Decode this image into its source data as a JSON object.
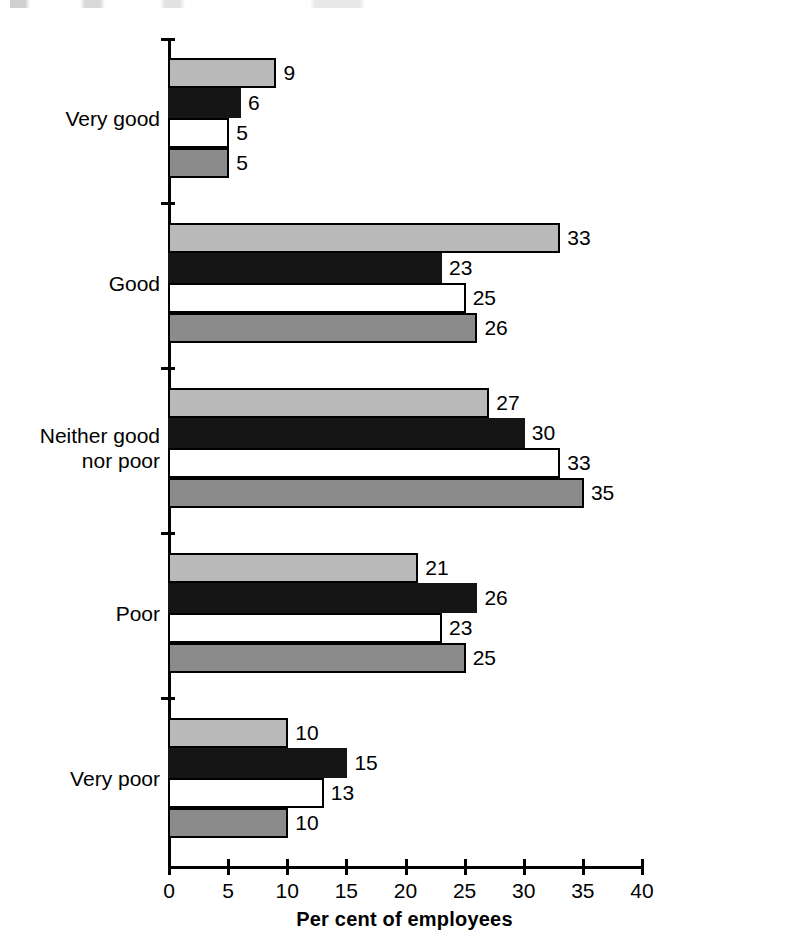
{
  "chart_data": {
    "type": "bar",
    "orientation": "horizontal",
    "title": "",
    "xlabel": "Per cent of employees",
    "ylabel": "",
    "xlim": [
      0,
      40
    ],
    "xticks": [
      0,
      5,
      10,
      15,
      20,
      25,
      30,
      35,
      40
    ],
    "grid": false,
    "legend": "none",
    "categories": [
      "Very good",
      "Good",
      "Neither good\nnor poor",
      "Poor",
      "Very poor"
    ],
    "category_lines": [
      [
        "Very good"
      ],
      [
        "Good"
      ],
      [
        "Neither good",
        "nor poor"
      ],
      [
        "Poor"
      ],
      [
        "Very poor"
      ]
    ],
    "series": [
      {
        "name": "series-1",
        "color": "#b9b9b9",
        "style": "light-grey",
        "values": [
          9,
          33,
          27,
          21,
          10
        ]
      },
      {
        "name": "series-2",
        "color": "#151515",
        "style": "black",
        "values": [
          6,
          23,
          30,
          26,
          15
        ]
      },
      {
        "name": "series-3",
        "color": "#ffffff",
        "style": "white",
        "values": [
          5,
          25,
          33,
          23,
          13
        ]
      },
      {
        "name": "series-4",
        "color": "#8b8b8b",
        "style": "mid-grey",
        "values": [
          5,
          26,
          35,
          25,
          10
        ]
      }
    ],
    "value_labels": {
      "Very good": [
        9,
        6,
        5,
        5
      ],
      "Good": [
        33,
        23,
        25,
        26
      ],
      "Neither good nor poor": [
        27,
        30,
        33,
        35
      ],
      "Poor": [
        21,
        26,
        23,
        25
      ],
      "Very poor": [
        10,
        15,
        13,
        10
      ]
    }
  },
  "axis": {
    "x_tick_labels": [
      "0",
      "5",
      "10",
      "15",
      "20",
      "25",
      "30",
      "35",
      "40"
    ],
    "x_axis_title": "Per cent of employees"
  },
  "colors": {
    "series_1": "#b9b9b9",
    "series_2": "#151515",
    "series_3": "#ffffff",
    "series_4": "#8b8b8b",
    "axis": "#000000",
    "background": "#ffffff"
  }
}
